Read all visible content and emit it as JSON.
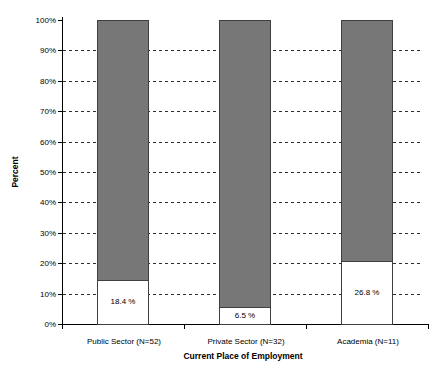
{
  "colors": {
    "background": "#ffffff",
    "bar_fill_upper": "#777777",
    "bar_fill_lower": "#ffffff",
    "bar_border": "#3f3f3f",
    "axis": "#000000",
    "grid": "#2e2e2e"
  },
  "chart_data": {
    "type": "bar",
    "subtype": "stacked-percent",
    "title": "",
    "xlabel": "Current Place of Employment",
    "ylabel": "Percent",
    "categories": [
      "Public Sector (N=52)",
      "Private Sector (N=32)",
      "Academia (N=11)"
    ],
    "series": [
      {
        "name": "labeled-share",
        "color": "#ffffff",
        "values": [
          18.4,
          6.5,
          26.8
        ],
        "value_labels": [
          "18.4 %",
          "6.5 %",
          "26.8 %"
        ],
        "drawn_pct": [
          14.2,
          5.3,
          20.4
        ]
      },
      {
        "name": "remainder",
        "color": "#777777",
        "values": [
          81.6,
          93.5,
          73.2
        ]
      }
    ],
    "ylim": [
      0,
      100
    ],
    "ytick_labels": [
      "0%",
      "10%",
      "20%",
      "30%",
      "40%",
      "50%",
      "60%",
      "70%",
      "80%",
      "90%",
      "100%"
    ],
    "grid": "horizontal-dashed",
    "legend": "none"
  }
}
